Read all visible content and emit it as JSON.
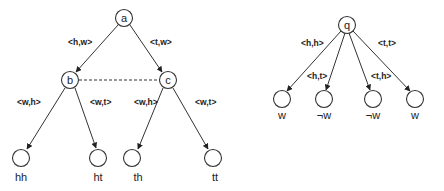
{
  "left_tree": {
    "root": {
      "label": "a"
    },
    "mid_left": {
      "label": "b"
    },
    "mid_right": {
      "label": "c"
    },
    "edges": {
      "a_b": "<h,w>",
      "a_c": "<t,w>",
      "b_hh": "<w,h>",
      "b_ht": "<w,t>",
      "c_th": "<w,h>",
      "c_tt": "<w,t>"
    },
    "leaves": [
      "hh",
      "ht",
      "th",
      "tt"
    ]
  },
  "right_tree": {
    "root": {
      "label": "q"
    },
    "edges": [
      "<h,h>",
      "<h,t>",
      "<t,h>",
      "<t,t>"
    ],
    "leaves": [
      "w",
      "¬w",
      "¬w",
      "w"
    ]
  },
  "colors": {
    "stroke": "#333333",
    "text": "#222222",
    "background": "#ffffff"
  }
}
